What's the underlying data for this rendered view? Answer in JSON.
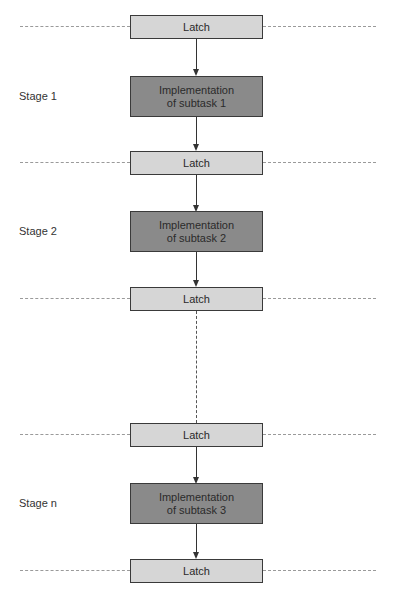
{
  "diagram": {
    "title": "",
    "latch_label": "Latch",
    "stages": [
      {
        "label": "Stage 1",
        "task": "Implementation of subtask 1",
        "task_line1": "Implementation",
        "task_line2": "of subtask 1"
      },
      {
        "label": "Stage 2",
        "task": "Implementation of subtask 2",
        "task_line1": "Implementation",
        "task_line2": "of subtask 2"
      },
      {
        "label": "Stage n",
        "task": "Implementation of subtask 3",
        "task_line1": "Implementation",
        "task_line2": "of subtask 3"
      }
    ],
    "latches": [
      "Latch",
      "Latch",
      "Latch",
      "Latch",
      "Latch"
    ],
    "colors": {
      "latch_fill": "#d6d6d6",
      "task_fill": "#8a8a8a",
      "border": "#3a3a3a",
      "boundary_dash": "#9a9a9a"
    }
  }
}
